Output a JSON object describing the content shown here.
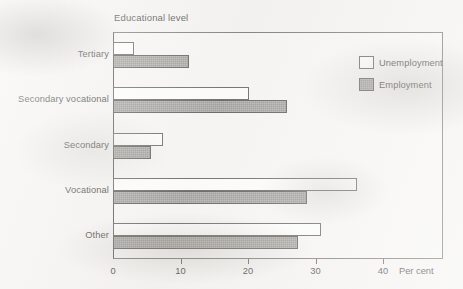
{
  "chart_data": {
    "type": "bar",
    "orientation": "horizontal",
    "title": "Educational level",
    "xlabel": "Per cent",
    "ylabel": "",
    "categories": [
      "Tertiary",
      "Secondary vocational",
      "Secondary",
      "Vocational",
      "Other"
    ],
    "series": [
      {
        "name": "Unemployment",
        "values": [
          3.1,
          20.1,
          7.4,
          36.2,
          30.8
        ],
        "color": "#ffffff",
        "edge_color": "#5a5855"
      },
      {
        "name": "Employment",
        "values": [
          11.3,
          25.8,
          5.6,
          28.7,
          27.4
        ],
        "color": "#8d8b87",
        "edge_color": "#4e4c49"
      }
    ],
    "xlim": [
      0,
      48.9
    ],
    "xticks": [
      0,
      10,
      20,
      30,
      40
    ],
    "xtick_labels": [
      "0",
      "10",
      "20",
      "30",
      "40"
    ],
    "grid": false,
    "legend_position": "top-right",
    "frame": true
  },
  "axis": {
    "unit_label": "Per cent"
  },
  "legend": {
    "items": [
      {
        "label": "Unemployment",
        "swatch": "unemployment"
      },
      {
        "label": "Employment",
        "swatch": "employment"
      }
    ]
  }
}
